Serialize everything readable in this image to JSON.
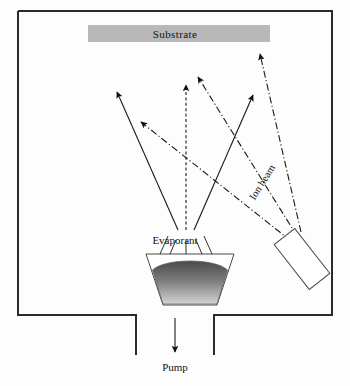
{
  "diagram": {
    "title_labels": {
      "substrate": "Substrate",
      "evaporant": "Evaporant",
      "ion_beam": "Ion beam",
      "pump": "Pump"
    },
    "colors": {
      "chamber_wall": "#2b2b2b",
      "substrate_fill": "#b8b8b8",
      "melt_dark": "#4a4a4a",
      "melt_light": "#d8d8d8",
      "line": "#1a1a1a",
      "background": "#fdfdfd"
    },
    "chamber": {
      "name": "vacuum-chamber",
      "left": 18,
      "top": 11,
      "right": 332,
      "bottom": 315,
      "stroke_width": 2,
      "pump_port_left": 136,
      "pump_port_right": 214,
      "pump_duct_bottom": 355
    },
    "substrate": {
      "name": "substrate-plate",
      "x": 88,
      "y": 25,
      "width": 182,
      "height": 17
    },
    "crucible": {
      "name": "evaporant-crucible",
      "top_left": 146,
      "top_right": 234,
      "top_y": 254,
      "bottom_left": 163,
      "bottom_right": 217,
      "bottom_y": 305,
      "melt_top_y": 262
    },
    "ion_source": {
      "name": "ion-source-gun",
      "cx": 302,
      "cy": 259,
      "width": 26,
      "height": 57,
      "rotation_deg": -38
    },
    "evaporant_flux_arrows": [
      {
        "name": "flux-arrow-left",
        "x1": 178,
        "y1": 252,
        "x2": 117,
        "y2": 92,
        "style": "solid"
      },
      {
        "name": "flux-arrow-center",
        "x1": 186,
        "y1": 252,
        "x2": 186,
        "y2": 85,
        "style": "dashed"
      },
      {
        "name": "flux-arrow-right",
        "x1": 194,
        "y1": 252,
        "x2": 253,
        "y2": 95,
        "style": "solid"
      }
    ],
    "ion_beam_arrows": [
      {
        "name": "ion-arrow-far-left",
        "x1": 290,
        "y1": 240,
        "x2": 141,
        "y2": 122,
        "style": "dashdot"
      },
      {
        "name": "ion-arrow-mid",
        "x1": 296,
        "y1": 237,
        "x2": 198,
        "y2": 77,
        "style": "dashdot"
      },
      {
        "name": "ion-arrow-right",
        "x1": 300,
        "y1": 233,
        "x2": 260,
        "y2": 54,
        "style": "dashdot"
      }
    ],
    "pump_arrow": {
      "name": "pump-flow-arrow",
      "x1": 175,
      "y1": 318,
      "x2": 175,
      "y2": 352
    },
    "crucible_emission_ticks": [
      {
        "x1": 170,
        "y1": 254,
        "x2": 176,
        "y2": 240
      },
      {
        "x1": 186,
        "y1": 254,
        "x2": 186,
        "y2": 240
      },
      {
        "x1": 202,
        "y1": 254,
        "x2": 196,
        "y2": 240
      }
    ]
  }
}
